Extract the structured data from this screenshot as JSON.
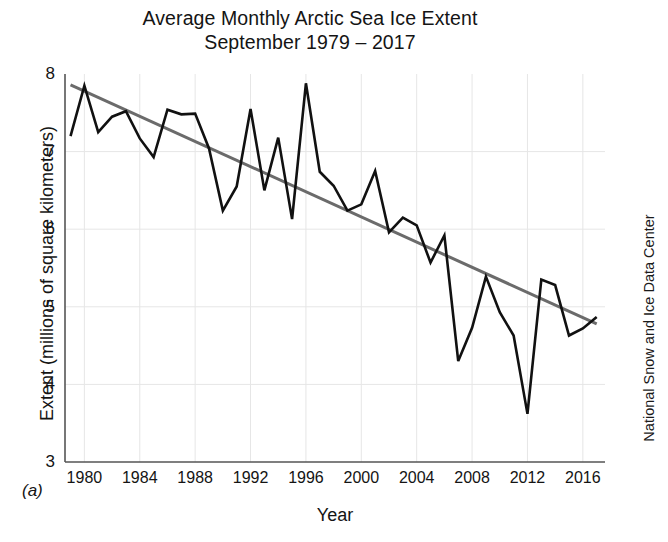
{
  "figure": {
    "panel_tag": "(a)",
    "credit": "National Snow and Ice Data Center",
    "title_line_1": "Average Monthly Arctic Sea Ice Extent",
    "title_line_2": "September 1979 – 2017"
  },
  "colors": {
    "series_line": "#111111",
    "trend_line": "#6b6b6b",
    "grid": "#e6e6e6",
    "axis": "#555555",
    "text": "#141414",
    "background": "#ffffff"
  },
  "chart_data": {
    "type": "line",
    "title": "Average Monthly Arctic Sea Ice Extent September 1979 – 2017",
    "xlabel": "Year",
    "ylabel": "Extent (millions of square kilometers)",
    "xlim": [
      1978.6,
      2017.6
    ],
    "ylim": [
      3,
      8
    ],
    "yticks": [
      3,
      4,
      5,
      6,
      7,
      8
    ],
    "ytick_labels": [
      "3",
      "4",
      "5",
      "6",
      "7",
      "8"
    ],
    "xticks": [
      1980,
      1984,
      1988,
      1992,
      1996,
      2000,
      2004,
      2008,
      2012,
      2016
    ],
    "xtick_labels": [
      "1980",
      "1984",
      "1988",
      "1992",
      "1996",
      "2000",
      "2004",
      "2008",
      "2012",
      "2016"
    ],
    "grid": true,
    "legend": false,
    "x": [
      1979,
      1980,
      1981,
      1982,
      1983,
      1984,
      1985,
      1986,
      1987,
      1988,
      1989,
      1990,
      1991,
      1992,
      1993,
      1994,
      1995,
      1996,
      1997,
      1998,
      1999,
      2000,
      2001,
      2002,
      2003,
      2004,
      2005,
      2006,
      2007,
      2008,
      2009,
      2010,
      2011,
      2012,
      2013,
      2014,
      2015,
      2016,
      2017
    ],
    "series": [
      {
        "name": "September sea ice extent",
        "color": "#111111",
        "units": "millions of square kilometers",
        "values": [
          7.2,
          7.85,
          7.25,
          7.45,
          7.52,
          7.17,
          6.93,
          7.54,
          7.48,
          7.49,
          7.04,
          6.24,
          6.55,
          7.55,
          6.5,
          7.18,
          6.13,
          7.88,
          6.74,
          6.56,
          6.24,
          6.32,
          6.75,
          5.96,
          6.15,
          6.05,
          5.57,
          5.92,
          4.3,
          4.73,
          5.39,
          4.93,
          4.63,
          3.62,
          5.35,
          5.28,
          4.63,
          4.72,
          4.87
        ]
      },
      {
        "name": "Linear trend",
        "color": "#6b6b6b",
        "type": "trend",
        "values_endpoints": [
          7.86,
          4.78
        ],
        "x_endpoints": [
          1979,
          2017
        ]
      }
    ]
  }
}
